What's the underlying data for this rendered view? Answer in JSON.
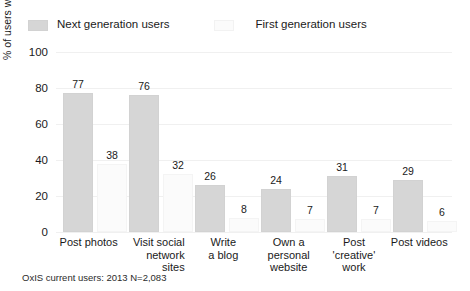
{
  "legend": {
    "entries": [
      {
        "label": "Next generation users",
        "color": "#d6d6d6",
        "swatch_name": "legend-swatch-next-generation"
      },
      {
        "label": "First generation users",
        "color": "#fbfbfb",
        "swatch_name": "legend-swatch-first-generation"
      }
    ]
  },
  "footnote": "OxIS current users: 2013 N=2,083",
  "chart_data": {
    "type": "bar",
    "title": "",
    "subtitle": "",
    "xlabel": "",
    "ylabel": "% of users who do more than never",
    "ylim": [
      0,
      100
    ],
    "yticks": [
      0,
      20,
      40,
      60,
      80,
      100
    ],
    "ytick_labels": [
      "0",
      "20",
      "40",
      "60",
      "80",
      "100"
    ],
    "grid": true,
    "grid_axis": "y",
    "legend_position": "top-left",
    "categories": [
      "Post photos",
      "Visit social network sites",
      "Write a blog",
      "Own a personal website",
      "Post 'creative' work",
      "Post videos"
    ],
    "category_lines": [
      [
        "Post photos"
      ],
      [
        "Visit social",
        "network",
        "sites"
      ],
      [
        "Write",
        "a blog"
      ],
      [
        "Own a",
        "personal",
        "website"
      ],
      [
        "Post",
        "'creative'",
        "work"
      ],
      [
        "Post videos"
      ]
    ],
    "category_align": [
      "center",
      "right",
      "center",
      "center",
      "center",
      "center"
    ],
    "series": [
      {
        "name": "Next generation users",
        "color": "#d6d6d6",
        "values": [
          77,
          76,
          26,
          24,
          31,
          29
        ],
        "labels": [
          "77",
          "76",
          "26",
          "24",
          "31",
          "29"
        ]
      },
      {
        "name": "First generation users",
        "color": "#fbfbfb",
        "values": [
          38,
          32,
          8,
          7,
          7,
          6
        ],
        "labels": [
          "38",
          "32",
          "8",
          "7",
          "7",
          "6"
        ]
      }
    ]
  }
}
